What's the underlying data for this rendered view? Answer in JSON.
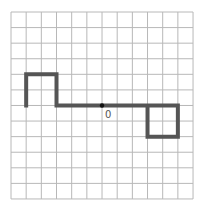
{
  "grid": {
    "x0": 11,
    "y0": 12,
    "cols": 12,
    "rows": 12,
    "cell_w": 15.17,
    "cell_h": 15.58,
    "line_color": "#b8b8b8"
  },
  "path": {
    "color": "#555555",
    "width": 4,
    "points": [
      [
        1,
        6
      ],
      [
        1,
        4
      ],
      [
        3,
        4
      ],
      [
        3,
        6
      ],
      [
        11,
        6
      ],
      [
        11,
        8
      ],
      [
        9,
        8
      ],
      [
        9,
        6
      ]
    ]
  },
  "origin": {
    "col": 6,
    "row": 6,
    "label": "0",
    "dot_color": "#111111"
  }
}
